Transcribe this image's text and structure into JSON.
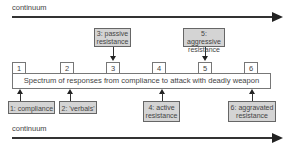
{
  "top_axis": {
    "label": "continuum"
  },
  "bottom_axis": {
    "label": "continuum"
  },
  "spectrum": {
    "text": "Spectrum of responses from compliance to attack with deadly weapon",
    "levels": [
      "1",
      "2",
      "3",
      "4",
      "5",
      "6"
    ]
  },
  "callouts_above": [
    {
      "line1": "3: passive",
      "line2": "resistance",
      "target": "3"
    },
    {
      "line1": "5: aggressive",
      "line2": "resistance",
      "target": "5"
    }
  ],
  "callouts_below": [
    {
      "line1": "1: compliance",
      "line2": "",
      "target": "1"
    },
    {
      "line1": "2: 'verbals'",
      "line2": "",
      "target": "2"
    },
    {
      "line1": "4: active",
      "line2": "resistance",
      "target": "4"
    },
    {
      "line1": "6: aggravated",
      "line2": "resistance",
      "target": "6"
    }
  ],
  "colors": {
    "callout_fill": "#d4d4d4",
    "line": "#333333",
    "background": "#ffffff"
  }
}
